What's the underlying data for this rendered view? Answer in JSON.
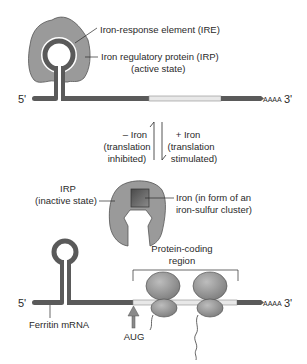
{
  "top_panel": {
    "five_prime": "5'",
    "three_prime": "3'",
    "poly_a": "AAAA",
    "ire_label": "Iron-response element (IRE)",
    "irp_label_line1": "Iron regulatory protein (IRP)",
    "irp_label_line2": "(active state)"
  },
  "transition": {
    "minus_iron": "– Iron",
    "minus_iron_sub1": "(translation",
    "minus_iron_sub2": "inhibited)",
    "plus_iron": "+ Iron",
    "plus_iron_sub1": "(translation",
    "plus_iron_sub2": "stimulated)"
  },
  "middle_panel": {
    "irp_label_line1": "IRP",
    "irp_label_line2": "(inactive state)",
    "iron_label_line1": "Iron (in form of an",
    "iron_label_line2": "iron-sulfur cluster)"
  },
  "bottom_panel": {
    "five_prime": "5'",
    "three_prime": "3'",
    "poly_a": "AAAA",
    "coding_label_line1": "Protein-coding",
    "coding_label_line2": "region",
    "mrna_label": "Ferritin mRNA",
    "start_codon": "AUG"
  },
  "colors": {
    "rna": "#5a5a5a",
    "coding_region": "#e8e8e8",
    "protein": "#9a9a9a",
    "cluster": "#6e6e6e",
    "text": "#2a2a2a"
  }
}
